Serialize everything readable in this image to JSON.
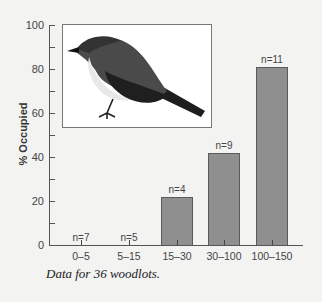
{
  "chart_data": {
    "type": "bar",
    "title": "",
    "xlabel": "",
    "ylabel": "% Occupied",
    "ylim": [
      0,
      100
    ],
    "yticks": [
      0,
      20,
      40,
      60,
      80,
      100
    ],
    "grid": false,
    "categories": [
      "0–5",
      "5–15",
      "15–30",
      "30–100",
      "100–150"
    ],
    "values": [
      0,
      0,
      22,
      42,
      81
    ],
    "annotations": [
      "n=7",
      "n=5",
      "n=4",
      "n=9",
      "n=11"
    ],
    "caption": "Data for 36 woodlots.",
    "inset_image": "bird-photo",
    "bar_color": "#8f8f8f"
  },
  "axis": {
    "ylabel": "% Occupied",
    "yticks": [
      "0",
      "20",
      "40",
      "60",
      "80",
      "100"
    ]
  },
  "bars": [
    {
      "category": "0–5",
      "value": 0,
      "n": "n=7"
    },
    {
      "category": "5–15",
      "value": 0,
      "n": "n=5"
    },
    {
      "category": "15–30",
      "value": 22,
      "n": "n=4"
    },
    {
      "category": "30–100",
      "value": 42,
      "n": "n=9"
    },
    {
      "category": "100–150",
      "value": 81,
      "n": "n=11"
    }
  ],
  "caption": "Data for 36 woodlots."
}
